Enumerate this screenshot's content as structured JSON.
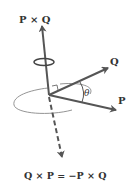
{
  "diagram": {
    "labels": {
      "p_cross_q": "P × Q",
      "q": "Q",
      "p": "P",
      "theta": "θ",
      "equation": "Q × P = −P × Q"
    },
    "colors": {
      "vector": "#555555",
      "text": "#333333",
      "ellipse": "#888888"
    }
  }
}
